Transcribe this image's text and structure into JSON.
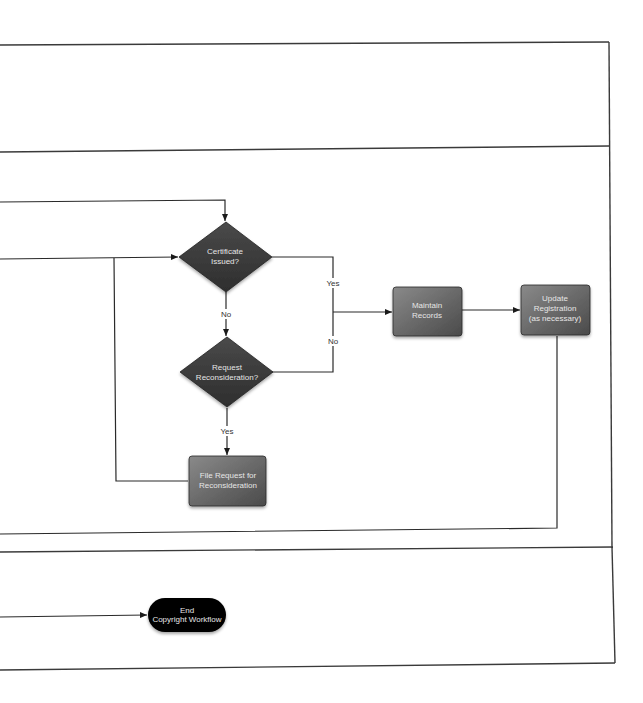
{
  "diagram": {
    "colors": {
      "node_fill_dark": "#3b3b3b",
      "node_fill_light": "#777777",
      "terminal_fill": "#050505",
      "line": "#2a2a2a",
      "lane_border": "#3a3a3a"
    },
    "nodes": {
      "certificate_issued": {
        "type": "decision",
        "lines": [
          "Certificate",
          "Issued?"
        ]
      },
      "request_reconsideration": {
        "type": "decision",
        "lines": [
          "Request",
          "Reconsideration?"
        ]
      },
      "file_request": {
        "type": "process",
        "lines": [
          "File Request for",
          "Reconsideration"
        ]
      },
      "maintain_records": {
        "type": "process",
        "lines": [
          "Maintain",
          "Records"
        ]
      },
      "update_registration": {
        "type": "process",
        "lines": [
          "Update",
          "Registration",
          "(as necessary)"
        ]
      },
      "end_workflow": {
        "type": "terminal",
        "lines": [
          "End",
          "Copyright Workflow"
        ]
      }
    },
    "edge_labels": {
      "cert_yes": "Yes",
      "cert_no": "No",
      "recon_no": "No",
      "recon_yes": "Yes"
    },
    "edges": [
      {
        "from": "offpage-left-top",
        "to": "certificate_issued"
      },
      {
        "from": "offpage-left-mid",
        "to": "certificate_issued"
      },
      {
        "from": "certificate_issued",
        "to": "maintain_records",
        "label": "Yes"
      },
      {
        "from": "certificate_issued",
        "to": "request_reconsideration",
        "label": "No"
      },
      {
        "from": "request_reconsideration",
        "to": "maintain_records",
        "label": "No"
      },
      {
        "from": "request_reconsideration",
        "to": "file_request",
        "label": "Yes"
      },
      {
        "from": "file_request",
        "to": "certificate_issued"
      },
      {
        "from": "maintain_records",
        "to": "update_registration"
      },
      {
        "from": "update_registration",
        "to": "offpage-left-bottom"
      },
      {
        "from": "offpage-left-end",
        "to": "end_workflow"
      }
    ]
  }
}
